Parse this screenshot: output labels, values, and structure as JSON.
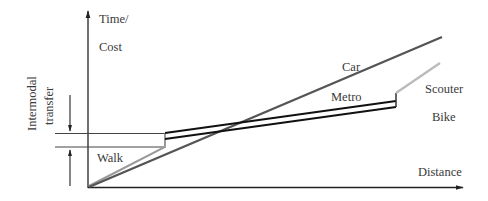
{
  "diagram": {
    "y_axis_label_line1": "Time/",
    "y_axis_label_line2": "Cost",
    "x_axis_label": "Distance",
    "transfer_label_line1": "Intermodal",
    "transfer_label_line2": "transfer",
    "modes": {
      "car": "Car",
      "metro": "Metro",
      "scouter": "Scouter",
      "bike": "Bike",
      "walk": "Walk"
    },
    "colors": {
      "axis": "#222222",
      "car": "#555555",
      "metro": "#111111",
      "scouter_bike": "#bbbbbb",
      "walk": "#999999",
      "transfer_lines": "#444444"
    }
  }
}
